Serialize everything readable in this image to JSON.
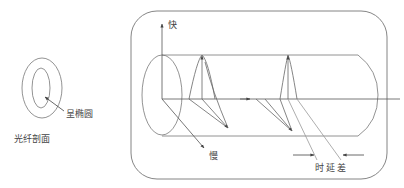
{
  "diagram": {
    "type": "polarization-mode-dispersion",
    "colors": {
      "stroke": "#666666",
      "text": "#444444",
      "background": "#ffffff"
    }
  },
  "cross_section": {
    "shape_label": "呈椭圆",
    "caption": "光纤剖面"
  },
  "fiber_view": {
    "fast_axis_label": "快",
    "slow_axis_label": "慢",
    "delay_label": "时延差"
  }
}
